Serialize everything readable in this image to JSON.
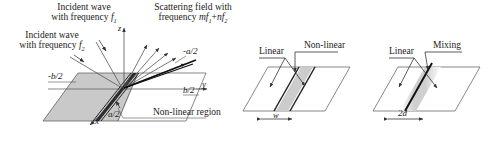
{
  "figure": {
    "type": "technical-schematic",
    "panel_count": 3
  },
  "colors": {
    "stroke": "#333333",
    "plane_shaded": "#c9c9c9",
    "plane_white": "#ffffff",
    "band_dark": "#1a1a1a",
    "band_gray": "#bdbdbd",
    "text": "#1a1a1a"
  },
  "panel_main": {
    "incident_1": {
      "line1": "Incident wave",
      "line2_pre": "with frequency ",
      "line2_sym": "f",
      "line2_sub": "1"
    },
    "incident_2": {
      "line1": "Incident wave",
      "line2_pre": "with frequency ",
      "line2_sym": "f",
      "line2_sub": "2"
    },
    "scattering": {
      "line1": "Scattering field with",
      "line2_pre": "frequency ",
      "line2_m": "m",
      "line2_f1": "f",
      "line2_sub1": "1",
      "line2_plus": "+",
      "line2_n": "n",
      "line2_f2": "f",
      "line2_sub2": "2"
    },
    "axes": {
      "z": "z",
      "y": "y",
      "x": "x"
    },
    "dim_minus_b": "-b/2",
    "dim_plus_b": "b/2",
    "dim_minus_a": "-a/2",
    "dim_plus_a": "a/2",
    "region_label": "Non-linear region"
  },
  "panel_middle": {
    "label_linear": "Linear",
    "label_nonlinear": "Non-linear",
    "dim_width": "w"
  },
  "panel_right": {
    "label_linear": "Linear",
    "label_mixing": "Mixing",
    "dim_width": "2d"
  }
}
